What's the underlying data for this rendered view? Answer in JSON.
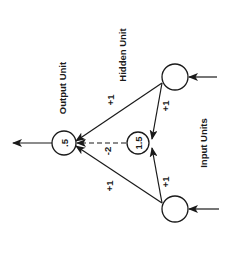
{
  "diagram": {
    "type": "neural-network",
    "orientation": "rotated -90deg",
    "labels": {
      "output_unit": "Output Unit",
      "hidden_unit": "Hidden Unit",
      "input_units": "Input Units"
    },
    "nodes": {
      "output": {
        "label": "Output Unit",
        "value": ".5"
      },
      "hidden": {
        "label": "Hidden Unit",
        "value": "1.5"
      },
      "input_top": {
        "label": "Input Unit",
        "value": ""
      },
      "input_bottom": {
        "label": "Input Unit",
        "value": ""
      }
    },
    "weights": {
      "input_top_to_output": "+1",
      "input_bottom_to_output": "+1",
      "input_top_to_hidden": "+1",
      "input_bottom_to_hidden": "+1",
      "hidden_to_output": "-2"
    },
    "edges": [
      {
        "from": "input_top",
        "to": "output",
        "weight": "+1",
        "style": "solid"
      },
      {
        "from": "input_bottom",
        "to": "output",
        "weight": "+1",
        "style": "solid"
      },
      {
        "from": "input_top",
        "to": "hidden",
        "weight": "+1",
        "style": "solid"
      },
      {
        "from": "input_bottom",
        "to": "hidden",
        "weight": "+1",
        "style": "solid"
      },
      {
        "from": "hidden",
        "to": "output",
        "weight": "-2",
        "style": "dashed"
      }
    ],
    "colors": {
      "stroke": "#1a1a1a",
      "background": "#ffffff"
    }
  }
}
